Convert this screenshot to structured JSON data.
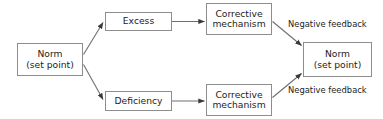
{
  "diagram": {
    "colors": {
      "background": "#ffffff",
      "box_border": "#8d8d8d",
      "connector": "#6f6f6f",
      "text": "#1c1c1c"
    },
    "nodes": [
      {
        "id": "norm-left",
        "lines": [
          "Norm",
          "(set point)"
        ],
        "line1": "Norm",
        "line2": "(set point)"
      },
      {
        "id": "excess",
        "lines": [
          "Excess"
        ],
        "line1": "Excess",
        "line2": ""
      },
      {
        "id": "deficiency",
        "lines": [
          "Deficiency"
        ],
        "line1": "Deficiency",
        "line2": ""
      },
      {
        "id": "corrective-top",
        "lines": [
          "Corrective",
          "mechanism"
        ],
        "line1": "Corrective",
        "line2": "mechanism"
      },
      {
        "id": "corrective-bottom",
        "lines": [
          "Corrective",
          "mechanism"
        ],
        "line1": "Corrective",
        "line2": "mechanism"
      },
      {
        "id": "norm-right",
        "lines": [
          "Norm",
          "(set point)"
        ],
        "line1": "Norm",
        "line2": "(set point)"
      }
    ],
    "edge_labels": [
      {
        "id": "negative-feedback-top",
        "text": "Negative feedback"
      },
      {
        "id": "negative-feedback-bottom",
        "text": "Negative feedback"
      }
    ],
    "connectors": [
      {
        "id": "norm-left-to-excess",
        "from": "norm-left",
        "to": "excess",
        "kind": "diagonal-up",
        "arrow": true
      },
      {
        "id": "norm-left-to-deficiency",
        "from": "norm-left",
        "to": "deficiency",
        "kind": "diagonal-down",
        "arrow": true
      },
      {
        "id": "excess-to-corrective-top",
        "from": "excess",
        "to": "corrective-top",
        "kind": "horizontal",
        "arrow": true
      },
      {
        "id": "deficiency-to-corrective-bottom",
        "from": "deficiency",
        "to": "corrective-bottom",
        "kind": "horizontal",
        "arrow": true
      },
      {
        "id": "corrective-top-to-norm-right",
        "from": "corrective-top",
        "to": "norm-right",
        "kind": "diagonal-down",
        "arrow": true,
        "label": "negative-feedback-top"
      },
      {
        "id": "corrective-bottom-to-norm-right",
        "from": "corrective-bottom",
        "to": "norm-right",
        "kind": "diagonal-up",
        "arrow": true,
        "label": "negative-feedback-bottom"
      }
    ]
  }
}
